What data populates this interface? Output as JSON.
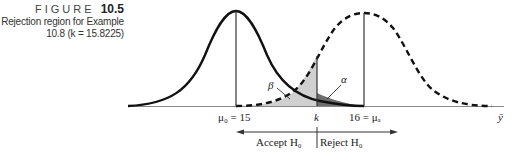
{
  "caption": {
    "figure_word": "FIGURE",
    "figure_number": "10.5",
    "line1": "Rejection region for Example",
    "line2": "10.8 (k = 15.8225)"
  },
  "diagram": {
    "axis_label": "ȳ",
    "mu0_label": "μ₀ = 15",
    "k_label": "k",
    "mua_label": "16 = μₐ",
    "beta_label": "β",
    "alpha_label": "α",
    "accept_label": "Accept H₀",
    "reject_label": "Reject H₀",
    "colors": {
      "curve": "#111111",
      "beta_fill": "#d0d0d0",
      "alpha_fill": "#6e6e6e",
      "axis": "#888888"
    }
  }
}
